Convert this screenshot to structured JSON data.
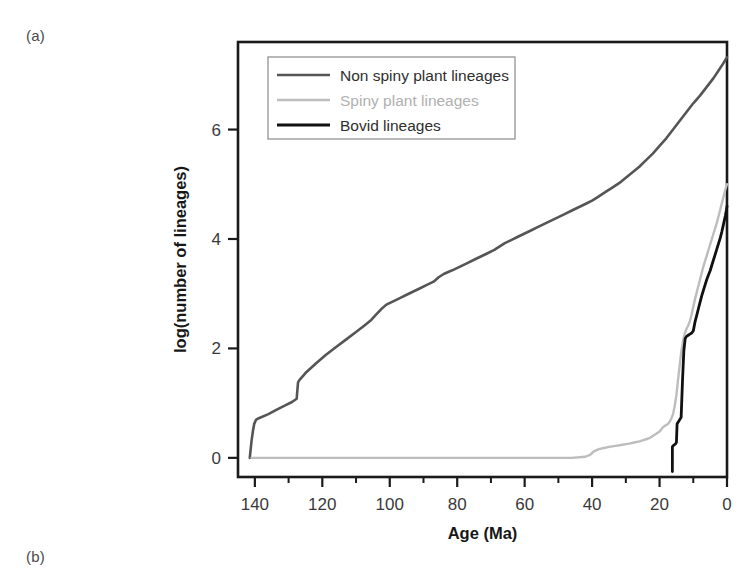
{
  "figure": {
    "panel_a_label": "(a)",
    "panel_b_label": "(b)"
  },
  "chart_data": {
    "type": "line",
    "title": "",
    "xlabel": "Age (Ma)",
    "ylabel": "log(number of lineages)",
    "xlim": [
      145,
      0
    ],
    "ylim": [
      -0.35,
      7.6
    ],
    "x_ticks": [
      140,
      120,
      100,
      80,
      60,
      40,
      20,
      0
    ],
    "x_minor_ticks": [
      130,
      110,
      90,
      70,
      50,
      30,
      10
    ],
    "y_ticks": [
      0,
      2,
      4,
      6
    ],
    "x_axis_reversed": true,
    "grid": false,
    "legend_position": "top-left-inside",
    "colors": {
      "non_spiny": "#555555",
      "spiny": "#bdbdbd",
      "bovid": "#111111",
      "axis": "#1a1a1a",
      "tick_label": "#3a3a3a",
      "legend_border": "#9a9a9a",
      "background": "#ffffff"
    },
    "series": [
      {
        "name": "Non spiny plant lineages",
        "color_key": "non_spiny",
        "legend_label": "Non spiny plant lineages",
        "x": [
          141.5,
          141.0,
          140.6,
          140.2,
          139.6,
          139.0,
          136.0,
          133.5,
          131.0,
          129.0,
          127.6,
          127.2,
          126.8,
          125.0,
          122.0,
          119.0,
          116.0,
          113.0,
          110.0,
          107.5,
          105.5,
          104.0,
          102.5,
          101.0,
          99.0,
          97.0,
          95.0,
          93.0,
          91.0,
          89.0,
          87.0,
          85.5,
          84.0,
          82.5,
          81.0,
          79.0,
          77.0,
          75.0,
          73.0,
          71.0,
          69.0,
          67.5,
          66.0,
          64.0,
          62.0,
          60.0,
          58.0,
          56.0,
          54.0,
          52.0,
          50.0,
          48.0,
          46.0,
          44.0,
          42.0,
          40.0,
          38.0,
          36.0,
          34.0,
          32.0,
          30.0,
          28.0,
          26.0,
          24.0,
          22.0,
          20.0,
          18.0,
          16.0,
          14.0,
          12.0,
          10.0,
          8.0,
          6.0,
          4.0,
          2.5,
          1.2,
          0.4,
          0.0
        ],
        "y": [
          0.0,
          0.3,
          0.48,
          0.62,
          0.7,
          0.72,
          0.8,
          0.88,
          0.96,
          1.02,
          1.08,
          1.38,
          1.42,
          1.55,
          1.72,
          1.88,
          2.02,
          2.16,
          2.3,
          2.42,
          2.52,
          2.62,
          2.72,
          2.8,
          2.86,
          2.92,
          2.98,
          3.04,
          3.1,
          3.16,
          3.22,
          3.3,
          3.36,
          3.4,
          3.44,
          3.5,
          3.56,
          3.62,
          3.68,
          3.74,
          3.8,
          3.86,
          3.92,
          3.98,
          4.04,
          4.1,
          4.16,
          4.22,
          4.28,
          4.34,
          4.4,
          4.46,
          4.52,
          4.58,
          4.64,
          4.7,
          4.78,
          4.86,
          4.94,
          5.02,
          5.12,
          5.22,
          5.32,
          5.44,
          5.56,
          5.7,
          5.84,
          6.0,
          6.16,
          6.32,
          6.48,
          6.62,
          6.78,
          6.94,
          7.08,
          7.2,
          7.28,
          7.32
        ]
      },
      {
        "name": "Spiny plant lineages",
        "color_key": "spiny",
        "legend_label": "Spiny plant lineages",
        "x": [
          141.0,
          130.0,
          120.0,
          110.0,
          100.0,
          90.0,
          80.0,
          70.0,
          60.0,
          52.0,
          46.0,
          42.0,
          40.5,
          39.5,
          38.0,
          36.5,
          35.0,
          33.0,
          31.0,
          29.0,
          27.5,
          26.0,
          25.0,
          24.0,
          23.0,
          22.0,
          21.0,
          20.0,
          19.5,
          19.0,
          18.5,
          18.0,
          17.5,
          17.0,
          16.5,
          16.0,
          15.5,
          15.0,
          14.6,
          14.2,
          13.8,
          13.4,
          13.0,
          12.5,
          12.0,
          11.5,
          11.0,
          10.5,
          10.0,
          9.5,
          9.0,
          8.5,
          8.0,
          7.5,
          7.0,
          6.5,
          6.0,
          5.5,
          5.0,
          4.5,
          4.0,
          3.5,
          3.0,
          2.5,
          2.0,
          1.5,
          1.0,
          0.5,
          0.0
        ],
        "y": [
          0.0,
          0.0,
          0.0,
          0.0,
          0.0,
          0.0,
          0.0,
          0.0,
          0.0,
          0.0,
          0.0,
          0.02,
          0.06,
          0.12,
          0.16,
          0.18,
          0.2,
          0.22,
          0.24,
          0.26,
          0.28,
          0.3,
          0.32,
          0.34,
          0.36,
          0.4,
          0.44,
          0.48,
          0.52,
          0.56,
          0.58,
          0.6,
          0.62,
          0.66,
          0.72,
          0.8,
          0.95,
          1.15,
          1.38,
          1.6,
          1.82,
          2.0,
          2.15,
          2.28,
          2.36,
          2.42,
          2.5,
          2.62,
          2.76,
          2.9,
          3.02,
          3.14,
          3.26,
          3.38,
          3.5,
          3.6,
          3.7,
          3.8,
          3.9,
          4.0,
          4.1,
          4.2,
          4.3,
          4.42,
          4.54,
          4.66,
          4.78,
          4.9,
          5.0
        ]
      },
      {
        "name": "Bovid lineages",
        "color_key": "bovid",
        "legend_label": "Bovid lineages",
        "x": [
          16.2,
          16.2,
          16.0,
          15.6,
          15.2,
          15.0,
          14.8,
          14.6,
          14.4,
          14.2,
          14.0,
          13.6,
          13.2,
          12.8,
          12.4,
          12.0,
          11.5,
          11.0,
          10.5,
          10.0,
          9.5,
          9.0,
          8.5,
          8.0,
          7.5,
          7.0,
          6.5,
          6.0,
          5.5,
          5.0,
          4.5,
          4.0,
          3.5,
          3.0,
          2.5,
          2.0,
          1.5,
          1.0,
          0.5,
          0.2,
          0.0
        ],
        "y": [
          -0.25,
          0.2,
          0.22,
          0.24,
          0.26,
          0.28,
          0.62,
          0.64,
          0.66,
          0.68,
          0.7,
          0.74,
          1.4,
          1.95,
          2.18,
          2.22,
          2.24,
          2.26,
          2.28,
          2.32,
          2.48,
          2.6,
          2.72,
          2.84,
          2.96,
          3.06,
          3.16,
          3.26,
          3.34,
          3.42,
          3.52,
          3.62,
          3.72,
          3.82,
          3.92,
          4.02,
          4.14,
          4.28,
          4.42,
          4.52,
          4.6
        ]
      }
    ]
  }
}
